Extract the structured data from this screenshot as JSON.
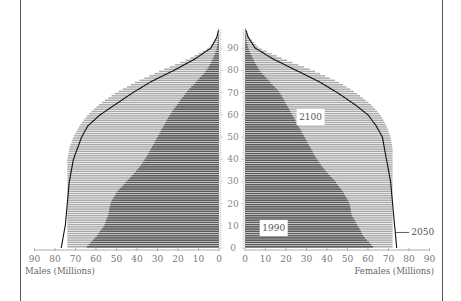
{
  "chart_data": {
    "type": "bar",
    "subtype": "population-pyramid",
    "title": "",
    "xlabel_left": "Males (Millions)",
    "xlabel_right": "Females (Millions)",
    "ylabel": "Age",
    "x_ticks": [
      0,
      10,
      20,
      30,
      40,
      50,
      60,
      70,
      80,
      90
    ],
    "y_ticks": [
      0,
      10,
      20,
      30,
      40,
      50,
      60,
      70,
      80,
      90
    ],
    "xlim": [
      0,
      90
    ],
    "ylim": [
      0,
      98
    ],
    "ages": [
      0,
      5,
      10,
      15,
      20,
      25,
      30,
      35,
      40,
      45,
      50,
      55,
      60,
      65,
      70,
      75,
      80,
      85,
      90,
      95,
      98
    ],
    "series": [
      {
        "name": "2100",
        "style": "light-gray-fill",
        "color": "#a8a8a8",
        "males": [
          74,
          74,
          74,
          74,
          74,
          74,
          74,
          74,
          74,
          73,
          71,
          68,
          64,
          58,
          50,
          40,
          28,
          15,
          5,
          1,
          0.3
        ],
        "females": [
          72,
          72,
          72,
          72,
          72,
          72,
          72,
          72,
          72,
          72,
          71,
          69,
          66,
          61,
          54,
          45,
          33,
          19,
          7,
          2,
          0.5
        ]
      },
      {
        "name": "1990",
        "style": "dark-gray-fill",
        "color": "#5a5a5a",
        "males": [
          65,
          60,
          56,
          54,
          53,
          50,
          45,
          40,
          36,
          33,
          30,
          27,
          24,
          20,
          16,
          11,
          6,
          3,
          1,
          0.3,
          0.1
        ],
        "females": [
          63,
          58,
          55,
          52,
          51,
          48,
          44,
          39,
          35,
          32,
          29,
          26,
          23,
          20,
          17,
          12,
          7,
          4,
          1.5,
          0.5,
          0.2
        ]
      },
      {
        "name": "2050",
        "style": "black-line",
        "color": "#111111",
        "males": [
          77,
          76,
          75,
          74.5,
          74,
          73.5,
          73,
          72,
          71,
          69,
          67,
          64,
          58,
          50,
          42,
          33,
          22,
          12,
          4,
          1,
          0.3
        ],
        "females": [
          74,
          73.5,
          73,
          72.5,
          72,
          71.5,
          71,
          70,
          69,
          68,
          67,
          64,
          60,
          53,
          45,
          36,
          25,
          14,
          5,
          1.5,
          0.5
        ]
      }
    ],
    "annotations": [
      {
        "text": "2100",
        "x_side": "female",
        "x": 32,
        "age": 59
      },
      {
        "text": "1990",
        "x_side": "female",
        "x": 14,
        "age": 9
      },
      {
        "text": "2050",
        "x_side": "female",
        "x": 83,
        "age": 7,
        "with_leader_line": true
      }
    ],
    "grid": false,
    "legend": "inline-labels"
  },
  "labels": {
    "males_axis_title": "Males (Millions)",
    "females_axis_title": "Females (Millions)",
    "label_2100": "2100",
    "label_1990": "1990",
    "label_2050": "2050"
  }
}
